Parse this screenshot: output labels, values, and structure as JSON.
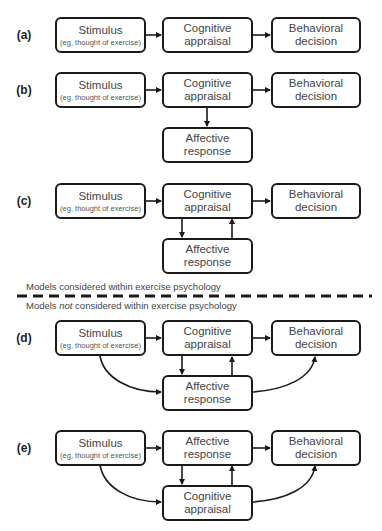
{
  "panels": [
    {
      "label": "(a)",
      "boxes": {
        "stimulus": {
          "title": "Stimulus",
          "subtitle": "(eg, thought of exercise)"
        },
        "middle": {
          "line1": "Cognitive",
          "line2": "appraisal"
        },
        "right": {
          "line1": "Behavioral",
          "line2": "decision"
        }
      }
    },
    {
      "label": "(b)",
      "boxes": {
        "stimulus": {
          "title": "Stimulus",
          "subtitle": "(eg, thought of exercise)"
        },
        "middle": {
          "line1": "Cognitive",
          "line2": "appraisal"
        },
        "right": {
          "line1": "Behavioral",
          "line2": "decision"
        },
        "bottom": {
          "line1": "Affective",
          "line2": "response"
        }
      }
    },
    {
      "label": "(c)",
      "boxes": {
        "stimulus": {
          "title": "Stimulus",
          "subtitle": "(eg, thought of exercise)"
        },
        "middle": {
          "line1": "Cognitive",
          "line2": "appraisal"
        },
        "right": {
          "line1": "Behavioral",
          "line2": "decision"
        },
        "bottom": {
          "line1": "Affective",
          "line2": "response"
        }
      }
    },
    {
      "label": "(d)",
      "boxes": {
        "stimulus": {
          "title": "Stimulus",
          "subtitle": "(eg, thought of exercise)"
        },
        "middle": {
          "line1": "Cognitive",
          "line2": "appraisal"
        },
        "right": {
          "line1": "Behavioral",
          "line2": "decision"
        },
        "bottom": {
          "line1": "Affective",
          "line2": "response"
        }
      }
    },
    {
      "label": "(e)",
      "boxes": {
        "stimulus": {
          "title": "Stimulus",
          "subtitle": "(eg, thought of exercise)"
        },
        "middle": {
          "line1": "Affective",
          "line2": "response"
        },
        "right": {
          "line1": "Behavioral",
          "line2": "decision"
        },
        "bottom": {
          "line1": "Cognitive",
          "line2": "appraisal"
        }
      }
    }
  ],
  "divider": {
    "above_label": "Models considered within exercise psychology",
    "below_prefix": "Models ",
    "below_emphasis": "not",
    "below_suffix": " considered within exercise psychology"
  }
}
